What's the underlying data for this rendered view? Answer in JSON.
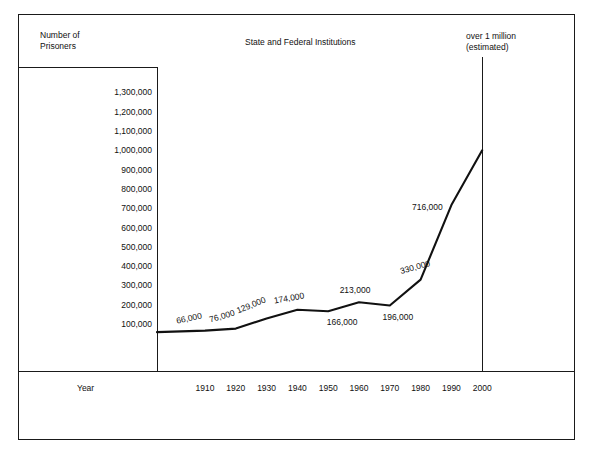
{
  "chart_data": {
    "type": "line",
    "title": "State and Federal Institutions",
    "ylabel": "Number of\nPrisoners",
    "xlabel": "Year",
    "grid": false,
    "legend": "none",
    "xlim": [
      1904,
      2000
    ],
    "ylim": [
      0,
      1350000
    ],
    "x_tick_labels": [
      "1910",
      "1920",
      "1930",
      "1940",
      "1950",
      "1960",
      "1970",
      "1980",
      "1990",
      "2000"
    ],
    "y_tick_labels": [
      "1,300,000",
      "1,200,000",
      "1,100,000",
      "1,000,000",
      "900,000",
      "800,000",
      "700,000",
      "600,000",
      "500,000",
      "400,000",
      "300,000",
      "200,000",
      "100,000"
    ],
    "y_tick_values": [
      1300000,
      1200000,
      1100000,
      1000000,
      900000,
      800000,
      700000,
      600000,
      500000,
      400000,
      300000,
      200000,
      100000
    ],
    "x": [
      1910,
      1920,
      1930,
      1940,
      1950,
      1960,
      1970,
      1980,
      1990,
      2000
    ],
    "values": [
      66000,
      76000,
      129000,
      174000,
      166000,
      213000,
      196000,
      330000,
      716000,
      1000000
    ],
    "point_labels": [
      "66,000",
      "76,000",
      "129,000",
      "174,000",
      "166,000",
      "213,000",
      "196,000",
      "330,000",
      "716,000",
      ""
    ],
    "annotations": [
      {
        "text": "over 1 million\n(estimated)",
        "x": 2000,
        "y": 1300000
      }
    ],
    "series_color": "#111111"
  },
  "figure": {
    "y_axis_caption": "Number of\nPrisoners",
    "title": "State and Federal Institutions",
    "estimate_note": "over 1 million\n(estimated)",
    "x_axis_caption": "Year"
  }
}
